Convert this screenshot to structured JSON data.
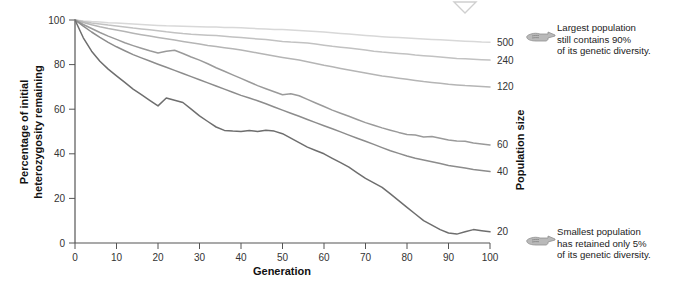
{
  "chart_data": {
    "type": "line",
    "title": "",
    "xlabel": "Generation",
    "ylabel": "Percentage of initial heterozygosity remaining",
    "y2label": "Population size",
    "xlim": [
      0,
      100
    ],
    "ylim": [
      0,
      100
    ],
    "xticks": [
      0,
      10,
      20,
      30,
      40,
      50,
      60,
      70,
      80,
      90,
      100
    ],
    "yticks": [
      0,
      20,
      40,
      60,
      80,
      100
    ],
    "grid": false,
    "legend_position": "right-end-of-line",
    "series": [
      {
        "name": "500",
        "label": "500",
        "color": "#d8d8d8",
        "end_value": 90,
        "x": [
          0,
          2,
          4,
          6,
          8,
          10,
          12,
          14,
          16,
          18,
          20,
          22,
          24,
          26,
          28,
          30,
          32,
          34,
          36,
          38,
          40,
          42,
          44,
          46,
          48,
          50,
          52,
          54,
          56,
          58,
          60,
          62,
          64,
          66,
          68,
          70,
          72,
          74,
          76,
          78,
          80,
          82,
          84,
          86,
          88,
          90,
          92,
          94,
          96,
          98,
          100
        ],
        "values": [
          100,
          99.6,
          99.3,
          99.1,
          98.8,
          98.6,
          98.4,
          98.2,
          98.0,
          97.8,
          97.6,
          97.4,
          97.3,
          97.2,
          97.1,
          97.0,
          96.9,
          96.8,
          96.7,
          96.6,
          96.5,
          96.3,
          96.1,
          95.9,
          95.8,
          95.7,
          95.5,
          95.3,
          95.1,
          94.9,
          94.6,
          94.3,
          94.0,
          93.7,
          93.4,
          93.1,
          92.8,
          92.5,
          92.3,
          92.1,
          91.9,
          91.7,
          91.5,
          91.3,
          91.1,
          90.9,
          90.7,
          90.5,
          90.3,
          90.1,
          90.0
        ]
      },
      {
        "name": "240",
        "label": "240",
        "color": "#c2c2c2",
        "end_value": 82,
        "x": [
          0,
          2,
          4,
          6,
          8,
          10,
          12,
          14,
          16,
          18,
          20,
          22,
          24,
          26,
          28,
          30,
          32,
          34,
          36,
          38,
          40,
          42,
          44,
          46,
          48,
          50,
          52,
          54,
          56,
          58,
          60,
          62,
          64,
          66,
          68,
          70,
          72,
          74,
          76,
          78,
          80,
          82,
          84,
          86,
          88,
          90,
          92,
          94,
          96,
          98,
          100
        ],
        "values": [
          100,
          99.3,
          98.7,
          98.2,
          97.7,
          97.3,
          96.9,
          96.4,
          96.0,
          95.6,
          95.2,
          94.7,
          94.3,
          93.9,
          93.6,
          93.4,
          93.2,
          93.0,
          92.7,
          92.4,
          92.1,
          91.8,
          91.5,
          91.2,
          90.8,
          90.4,
          90.1,
          89.9,
          89.7,
          89.2,
          88.7,
          88.2,
          87.8,
          87.4,
          87.0,
          86.5,
          86.0,
          85.6,
          85.3,
          85.0,
          84.7,
          84.3,
          84.0,
          83.7,
          83.4,
          83.1,
          82.8,
          82.6,
          82.4,
          82.2,
          82.0
        ]
      },
      {
        "name": "120",
        "label": "120",
        "color": "#b5b5b5",
        "end_value": 70,
        "x": [
          0,
          2,
          4,
          6,
          8,
          10,
          12,
          14,
          16,
          18,
          20,
          22,
          24,
          26,
          28,
          30,
          32,
          34,
          36,
          38,
          40,
          42,
          44,
          46,
          48,
          50,
          52,
          54,
          56,
          58,
          60,
          62,
          64,
          66,
          68,
          70,
          72,
          74,
          76,
          78,
          80,
          82,
          84,
          86,
          88,
          90,
          92,
          94,
          96,
          98,
          100
        ],
        "values": [
          100,
          98.9,
          97.9,
          97.0,
          96.2,
          95.5,
          94.8,
          94.1,
          93.4,
          92.8,
          92.2,
          91.6,
          91.0,
          90.4,
          89.8,
          89.2,
          88.6,
          88.1,
          87.6,
          87.1,
          86.5,
          85.9,
          85.2,
          84.5,
          83.8,
          83.2,
          82.6,
          82.0,
          81.3,
          80.5,
          79.7,
          79.0,
          78.3,
          77.6,
          76.9,
          76.2,
          75.5,
          74.9,
          74.4,
          73.9,
          73.4,
          72.9,
          72.4,
          72.0,
          71.6,
          71.2,
          70.9,
          70.6,
          70.4,
          70.2,
          70.0
        ]
      },
      {
        "name": "60",
        "label": "60",
        "color": "#9a9a9a",
        "end_value": 44,
        "x": [
          0,
          2,
          4,
          6,
          8,
          10,
          12,
          14,
          16,
          18,
          20,
          22,
          24,
          26,
          28,
          30,
          32,
          34,
          36,
          38,
          40,
          42,
          44,
          46,
          48,
          50,
          52,
          54,
          56,
          58,
          60,
          62,
          64,
          66,
          68,
          70,
          72,
          74,
          76,
          78,
          80,
          82,
          84,
          86,
          88,
          90,
          92,
          94,
          96,
          98,
          100
        ],
        "values": [
          100,
          98.0,
          96.2,
          94.4,
          92.8,
          91.3,
          89.8,
          88.5,
          87.3,
          86.2,
          85.2,
          86.0,
          86.4,
          85.0,
          83.4,
          82.0,
          80.4,
          78.6,
          77.0,
          75.4,
          73.8,
          72.2,
          70.6,
          69.2,
          67.8,
          66.5,
          66.9,
          66.0,
          64.4,
          62.8,
          61.2,
          59.6,
          58.2,
          56.8,
          55.4,
          54.0,
          52.8,
          51.6,
          50.6,
          49.6,
          48.7,
          48.4,
          47.6,
          47.8,
          47.0,
          46.2,
          45.8,
          45.6,
          44.8,
          44.4,
          44.0
        ]
      },
      {
        "name": "40",
        "label": "40",
        "color": "#8c8c8c",
        "end_value": 32,
        "x": [
          0,
          2,
          4,
          6,
          8,
          10,
          12,
          14,
          16,
          18,
          20,
          22,
          24,
          26,
          28,
          30,
          32,
          34,
          36,
          38,
          40,
          42,
          44,
          46,
          48,
          50,
          52,
          54,
          56,
          58,
          60,
          62,
          64,
          66,
          68,
          70,
          72,
          74,
          76,
          78,
          80,
          82,
          84,
          86,
          88,
          90,
          92,
          94,
          96,
          98,
          100
        ],
        "values": [
          100,
          97.2,
          94.6,
          92.2,
          90.0,
          88.0,
          86.2,
          84.5,
          83.0,
          81.6,
          80.2,
          78.8,
          77.4,
          76.0,
          74.6,
          73.2,
          71.8,
          70.4,
          69.0,
          67.6,
          66.2,
          65.0,
          63.8,
          62.4,
          61.0,
          59.6,
          58.2,
          56.8,
          55.4,
          54.0,
          52.6,
          51.2,
          49.8,
          48.4,
          47.0,
          45.6,
          44.2,
          42.8,
          41.4,
          40.2,
          39.0,
          38.0,
          37.2,
          36.4,
          35.6,
          34.8,
          34.2,
          33.6,
          33.0,
          32.5,
          32.0
        ]
      },
      {
        "name": "20",
        "label": "20",
        "color": "#6e6e6e",
        "end_value": 5,
        "x": [
          0,
          2,
          4,
          6,
          8,
          10,
          12,
          14,
          16,
          18,
          20,
          22,
          24,
          26,
          28,
          30,
          32,
          34,
          36,
          38,
          40,
          42,
          44,
          46,
          48,
          50,
          52,
          54,
          56,
          58,
          60,
          62,
          64,
          66,
          68,
          70,
          72,
          74,
          76,
          78,
          80,
          82,
          84,
          86,
          88,
          90,
          92,
          94,
          96,
          98,
          100
        ],
        "values": [
          100,
          92.0,
          86.0,
          81.5,
          78.0,
          75.0,
          72.0,
          69.0,
          66.5,
          64.0,
          61.5,
          65.0,
          64.0,
          63.0,
          60.0,
          57.0,
          54.5,
          52.0,
          50.5,
          50.2,
          50.0,
          50.4,
          50.0,
          50.6,
          50.2,
          49.0,
          47.0,
          45.0,
          43.0,
          41.5,
          40.0,
          38.0,
          36.0,
          34.0,
          31.5,
          29.0,
          27.0,
          25.0,
          22.0,
          19.0,
          16.0,
          13.0,
          10.0,
          8.0,
          6.0,
          4.5,
          4.0,
          5.0,
          6.0,
          5.5,
          5.0
        ]
      }
    ]
  },
  "annotations": {
    "top": {
      "text": "Largest population\nstill contains 90%\nof its genetic diversity.",
      "icon": "pointing-hand-icon",
      "points_to_series": "500"
    },
    "bottom": {
      "text": "Smallest population\nhas retained only 5%\nof its genetic diversity.",
      "icon": "pointing-hand-icon",
      "points_to_series": "20"
    }
  },
  "marker": {
    "name": "triangle-down-marker",
    "color": "#cfcfcf"
  },
  "colors": {
    "axis": "#555555",
    "text": "#1a1a1a"
  }
}
